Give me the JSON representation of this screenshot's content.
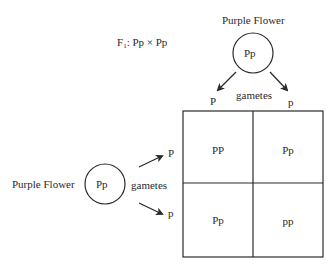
{
  "cross": {
    "generation": "F",
    "generation_sub": "1",
    "text": ": Pp × Pp"
  },
  "top_parent": {
    "label": "Purple Flower",
    "genotype": "Pp",
    "gametes_label": "gametes",
    "gametes": [
      "P",
      "p"
    ]
  },
  "left_parent": {
    "label": "Purple Flower",
    "genotype": "Pp",
    "gametes_label": "gametes",
    "gametes": [
      "P",
      "p"
    ]
  },
  "punnett": {
    "cells": [
      [
        "PP",
        "Pp"
      ],
      [
        "Pp",
        "pp"
      ]
    ]
  },
  "colors": {
    "line": "#2a2a2a",
    "background": "#ffffff"
  }
}
